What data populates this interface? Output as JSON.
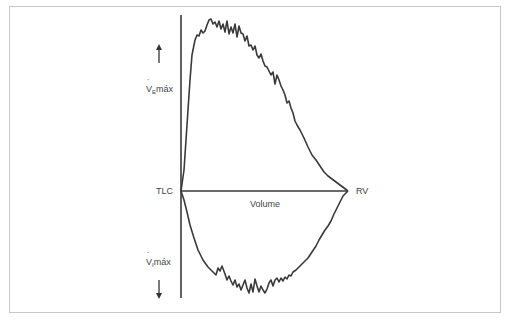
{
  "diagram": {
    "type": "flow-volume loop",
    "labels": {
      "tlc": "TLC",
      "rv": "RV",
      "volume": "Volume",
      "expiratory_prefix": "V",
      "expiratory_sub": "E",
      "expiratory_suffix": "máx",
      "inspiratory_prefix": "V",
      "inspiratory_sub": "I",
      "inspiratory_suffix": "máx"
    },
    "arrows": {
      "expiratory": "up",
      "inspiratory": "down"
    },
    "colors": {
      "line": "#3a3a3a",
      "text": "#444444",
      "frame": "#c8c8c8"
    }
  }
}
